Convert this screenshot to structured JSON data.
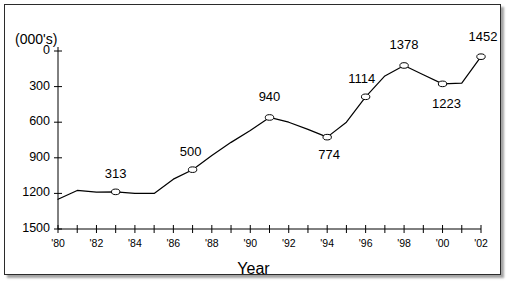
{
  "figure": {
    "units_label": "(000's)",
    "x_axis_title": "Year"
  },
  "chart_data": {
    "type": "line",
    "title": "",
    "subtitle": "",
    "xlabel": "Year",
    "ylabel": "(000's)",
    "units_note": "(000's)",
    "xlim": [
      "'80",
      "'02"
    ],
    "ylim": [
      0,
      1500
    ],
    "grid": false,
    "legend": false,
    "legend_position": "none",
    "marker": "open-circle",
    "line_color": "#000000",
    "y_ticks": [
      0,
      300,
      600,
      900,
      1200,
      1500
    ],
    "y_tick_labels": [
      "0",
      "300",
      "600",
      "900",
      "1200",
      "1500"
    ],
    "x_ticks": [
      "'80",
      "'81",
      "'82",
      "'83",
      "'84",
      "'85",
      "'86",
      "'87",
      "'88",
      "'89",
      "'90",
      "'91",
      "'92",
      "'93",
      "'94",
      "'95",
      "'96",
      "'97",
      "'98",
      "'99",
      "'00",
      "'01",
      "'02"
    ],
    "x_tick_labels_shown": [
      "'80",
      "'82",
      "'84",
      "'86",
      "'88",
      "'90",
      "'92",
      "'94",
      "'96",
      "'98",
      "'00",
      "'02"
    ],
    "x": [
      "'80",
      "'81",
      "'82",
      "'83",
      "'84",
      "'85",
      "'86",
      "'87",
      "'88",
      "'89",
      "'90",
      "'91",
      "'92",
      "'93",
      "'94",
      "'95",
      "'96",
      "'97",
      "'98",
      "'99",
      "'00",
      "'01",
      "'02"
    ],
    "values": [
      250,
      325,
      310,
      313,
      300,
      300,
      420,
      500,
      620,
      730,
      830,
      940,
      900,
      840,
      774,
      900,
      1114,
      1290,
      1378,
      1300,
      1223,
      1230,
      1452
    ],
    "labeled_points": [
      {
        "x": "'83",
        "value": 313,
        "label": "313"
      },
      {
        "x": "'87",
        "value": 500,
        "label": "500"
      },
      {
        "x": "'91",
        "value": 940,
        "label": "940"
      },
      {
        "x": "'94",
        "value": 774,
        "label": "774"
      },
      {
        "x": "'96",
        "value": 1114,
        "label": "1114"
      },
      {
        "x": "'98",
        "value": 1378,
        "label": "1378"
      },
      {
        "x": "'00",
        "value": 1223,
        "label": "1223"
      },
      {
        "x": "'02",
        "value": 1452,
        "label": "1452"
      }
    ]
  },
  "y_ticks": [
    {
      "label": "1500"
    },
    {
      "label": "1200"
    },
    {
      "label": "900"
    },
    {
      "label": "600"
    },
    {
      "label": "300"
    },
    {
      "label": "0"
    }
  ],
  "x_ticks": [
    {
      "label": "'80"
    },
    {
      "label": "'82"
    },
    {
      "label": "'84"
    },
    {
      "label": "'86"
    },
    {
      "label": "'88"
    },
    {
      "label": "'90"
    },
    {
      "label": "'92"
    },
    {
      "label": "'94"
    },
    {
      "label": "'96"
    },
    {
      "label": "'98"
    },
    {
      "label": "'00"
    },
    {
      "label": "'02"
    }
  ],
  "point_labels": [
    {
      "label": "313"
    },
    {
      "label": "500"
    },
    {
      "label": "940"
    },
    {
      "label": "774"
    },
    {
      "label": "1114"
    },
    {
      "label": "1378"
    },
    {
      "label": "1223"
    },
    {
      "label": "1452"
    }
  ]
}
